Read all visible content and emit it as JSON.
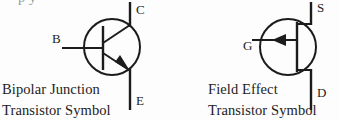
{
  "canvas": {
    "width": 339,
    "height": 120,
    "background": "#fdfdfd",
    "ink": "#1c1c1c"
  },
  "clipped_top_line": {
    "text": "p  y",
    "note": "partially cropped text line at very top edge"
  },
  "bjt": {
    "symbol_name": "npn-bipolar-junction-transistor",
    "caption_line1": "Bipolar Junction",
    "caption_line2": "Transistor Symbol",
    "terminals": [
      {
        "key": "base",
        "label": "B"
      },
      {
        "key": "collector",
        "label": "C"
      },
      {
        "key": "emitter",
        "label": "E"
      }
    ]
  },
  "fet": {
    "symbol_name": "n-channel-junction-field-effect-transistor",
    "caption_line1": "Field Effect",
    "caption_line2": "Transistor Symbol",
    "terminals": [
      {
        "key": "gate",
        "label": "G"
      },
      {
        "key": "source",
        "label": "S"
      },
      {
        "key": "drain",
        "label": "D"
      }
    ]
  }
}
